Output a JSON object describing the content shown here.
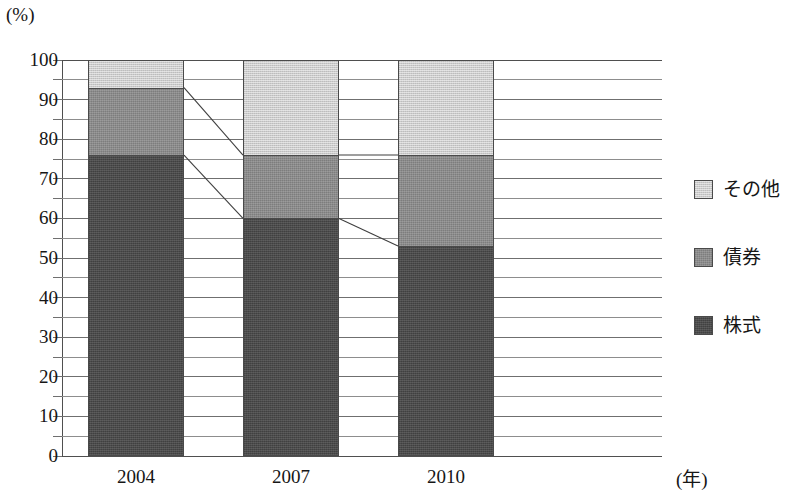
{
  "chart_data": {
    "type": "bar",
    "subtype": "stacked-percentage",
    "title": "",
    "xlabel": "(年)",
    "ylabel": "(%)",
    "ylim": [
      0,
      100
    ],
    "ytick_step": 10,
    "grid": true,
    "gridline_step": 5,
    "categories": [
      "2004",
      "2007",
      "2010"
    ],
    "ytick_labels": [
      "0",
      "10",
      "20",
      "30",
      "40",
      "50",
      "60",
      "70",
      "80",
      "90",
      "100"
    ],
    "legend_position": "right",
    "series": [
      {
        "name": "その他",
        "key": "other",
        "color": "#cbcbcb",
        "values": [
          7,
          24,
          24
        ]
      },
      {
        "name": "債券",
        "key": "bonds",
        "color": "#8b8b8b",
        "values": [
          17,
          16,
          23
        ]
      },
      {
        "name": "株式",
        "key": "stocks",
        "color": "#4b4b4b",
        "values": [
          76,
          60,
          53
        ]
      }
    ],
    "stack_boundaries": [
      {
        "category": "2004",
        "stocks_top": 76,
        "bonds_top": 93,
        "other_top": 100
      },
      {
        "category": "2007",
        "stocks_top": 60,
        "bonds_top": 76,
        "other_top": 100
      },
      {
        "category": "2010",
        "stocks_top": 53,
        "bonds_top": 76,
        "other_top": 100
      }
    ],
    "connectors": [
      {
        "from_category": "2004",
        "to_category": "2007",
        "boundary": "bonds_top",
        "from_value": 93,
        "to_value": 76
      },
      {
        "from_category": "2004",
        "to_category": "2007",
        "boundary": "stocks_top",
        "from_value": 76,
        "to_value": 60
      },
      {
        "from_category": "2007",
        "to_category": "2010",
        "boundary": "bonds_top",
        "from_value": 76,
        "to_value": 76
      },
      {
        "from_category": "2007",
        "to_category": "2010",
        "boundary": "stocks_top",
        "from_value": 60,
        "to_value": 53
      }
    ]
  },
  "axes": {
    "y_unit": "(%)",
    "x_unit": "(年)",
    "y_labels": [
      "100",
      "90",
      "80",
      "70",
      "60",
      "50",
      "40",
      "30",
      "20",
      "10",
      "0"
    ],
    "x_labels": [
      "2004",
      "2007",
      "2010"
    ]
  },
  "legend": {
    "items": [
      {
        "label": "その他",
        "color": "#cbcbcb"
      },
      {
        "label": "債券",
        "color": "#8b8b8b"
      },
      {
        "label": "株式",
        "color": "#4b4b4b"
      }
    ]
  }
}
